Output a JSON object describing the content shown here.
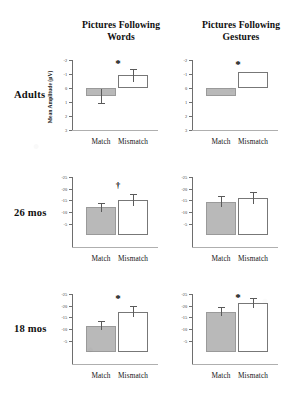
{
  "figure": {
    "y_axis_title": "Mean Amplitude (µV)",
    "columns": [
      {
        "id": "words",
        "title_line1": "Pictures Following",
        "title_line2": "Words"
      },
      {
        "id": "gestures",
        "title_line1": "Pictures Following",
        "title_line2": "Gestures"
      }
    ],
    "rows": [
      {
        "id": "adults",
        "label": "Adults"
      },
      {
        "id": "mos26",
        "label": "26 mos"
      },
      {
        "id": "mos18",
        "label": "18 mos"
      }
    ],
    "category_labels": {
      "match": "Match",
      "mismatch": "Mismatch"
    },
    "significance_glyphs": {
      "star": "*",
      "dagger": "†"
    },
    "colors": {
      "match_bar_fill": "#b9b9b9",
      "match_bar_stroke": "#9a9a9a",
      "mismatch_bar_fill": "#ffffff",
      "mismatch_bar_stroke": "#777777",
      "axis": "#6e6e6e",
      "error_bar": "#5a5a5a",
      "text": "#101010",
      "background": "#ffffff"
    }
  },
  "chart_data": [
    {
      "type": "bar",
      "id": "adults-words",
      "title": "Pictures Following Words",
      "row": "Adults",
      "xlabel": "",
      "ylabel": "Mean Amplitude (µV)",
      "y_inverted": true,
      "ylim": [
        -2,
        3
      ],
      "yticks": [
        -2,
        -1,
        0,
        1,
        2,
        3
      ],
      "ytick_labels": [
        "-2",
        "-1",
        "0",
        "1",
        "2",
        "3"
      ],
      "grid": false,
      "legend": "none",
      "categories": [
        "Match",
        "Mismatch"
      ],
      "values": [
        0.6,
        -0.9
      ],
      "errors": [
        0.5,
        0.45
      ],
      "annotation": "*"
    },
    {
      "type": "bar",
      "id": "adults-gestures",
      "title": "Pictures Following Gestures",
      "row": "Adults",
      "xlabel": "",
      "ylabel": "",
      "y_inverted": true,
      "ylim": [
        -2,
        3
      ],
      "yticks": [
        -2,
        -1,
        0,
        1,
        2,
        3
      ],
      "ytick_labels": [
        "-2",
        "-1",
        "0",
        "1",
        "2",
        "3"
      ],
      "grid": false,
      "legend": "none",
      "categories": [
        "Match",
        "Mismatch"
      ],
      "values": [
        0.55,
        -1.15
      ],
      "errors": [
        0.0,
        0.0
      ],
      "annotation": "*"
    },
    {
      "type": "bar",
      "id": "mos26-words",
      "title": "Pictures Following Words",
      "row": "26 mos",
      "xlabel": "",
      "ylabel": "",
      "y_inverted": true,
      "ylim": [
        -25,
        5
      ],
      "yticks": [
        -25,
        -20,
        -15,
        -10,
        -5
      ],
      "ytick_labels": [
        "-25",
        "-20",
        "-15",
        "-10",
        "-5"
      ],
      "grid": false,
      "legend": "none",
      "categories": [
        "Match",
        "Mismatch"
      ],
      "values": [
        -12.0,
        -15.0
      ],
      "errors": [
        2.0,
        2.6
      ],
      "annotation": "†"
    },
    {
      "type": "bar",
      "id": "mos26-gestures",
      "title": "Pictures Following Gestures",
      "row": "26 mos",
      "xlabel": "",
      "ylabel": "",
      "y_inverted": true,
      "ylim": [
        -25,
        5
      ],
      "yticks": [
        -25,
        -20,
        -15,
        -10,
        -5
      ],
      "ytick_labels": [
        "-25",
        "-20",
        "-15",
        "-10",
        "-5"
      ],
      "grid": false,
      "legend": "none",
      "categories": [
        "Match",
        "Mismatch"
      ],
      "values": [
        -14.5,
        -16.0
      ],
      "errors": [
        2.2,
        2.4
      ],
      "annotation": ""
    },
    {
      "type": "bar",
      "id": "mos18-words",
      "title": "Pictures Following Words",
      "row": "18 mos",
      "xlabel": "",
      "ylabel": "",
      "y_inverted": true,
      "ylim": [
        -25,
        5
      ],
      "yticks": [
        -25,
        -20,
        -15,
        -10,
        -5
      ],
      "ytick_labels": [
        "-25",
        "-20",
        "-15",
        "-10",
        "-5"
      ],
      "grid": false,
      "legend": "none",
      "categories": [
        "Match",
        "Mismatch"
      ],
      "values": [
        -11.5,
        -17.5
      ],
      "errors": [
        2.0,
        2.3
      ],
      "annotation": "*"
    },
    {
      "type": "bar",
      "id": "mos18-gestures",
      "title": "Pictures Following Gestures",
      "row": "18 mos",
      "xlabel": "",
      "ylabel": "",
      "y_inverted": true,
      "ylim": [
        -25,
        5
      ],
      "yticks": [
        -25,
        -20,
        -15,
        -10,
        -5
      ],
      "ytick_labels": [
        "-25",
        "-20",
        "-15",
        "-10",
        "-5"
      ],
      "grid": false,
      "legend": "none",
      "categories": [
        "Match",
        "Mismatch"
      ],
      "values": [
        -17.5,
        -21.0
      ],
      "errors": [
        1.8,
        2.2
      ],
      "annotation": "*"
    }
  ]
}
